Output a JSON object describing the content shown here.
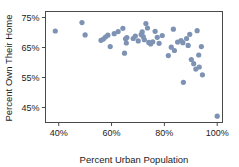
{
  "chart_data": {
    "type": "scatter",
    "title": "",
    "xlabel": "Percent Urban Population",
    "ylabel": "Percent Own Their Home",
    "xlim": [
      35,
      102
    ],
    "ylim": [
      40,
      77
    ],
    "grid": false,
    "legend": null,
    "xticks": [
      40,
      60,
      80,
      100
    ],
    "xtick_labels": [
      "40%",
      "60%",
      "80%",
      "100%"
    ],
    "yticks": [
      45,
      55,
      65,
      75
    ],
    "ytick_labels": [
      "45%",
      "55%",
      "65%",
      "75%"
    ],
    "marker": {
      "shape": "circle",
      "color": "#7e93b4",
      "size": 2.6
    },
    "frame_color": "#4a4a4a",
    "points": [
      {
        "x": 38.7,
        "y": 70.5
      },
      {
        "x": 48.8,
        "y": 73.3
      },
      {
        "x": 50.0,
        "y": 69.2
      },
      {
        "x": 56.0,
        "y": 67.4
      },
      {
        "x": 56.9,
        "y": 67.8
      },
      {
        "x": 57.7,
        "y": 68.5
      },
      {
        "x": 58.6,
        "y": 69.1
      },
      {
        "x": 59.5,
        "y": 65.3
      },
      {
        "x": 61.0,
        "y": 69.6
      },
      {
        "x": 62.5,
        "y": 70.3
      },
      {
        "x": 64.3,
        "y": 71.4
      },
      {
        "x": 64.9,
        "y": 63.1
      },
      {
        "x": 65.3,
        "y": 67.9
      },
      {
        "x": 65.6,
        "y": 66.5
      },
      {
        "x": 65.8,
        "y": 68.3
      },
      {
        "x": 68.2,
        "y": 68.0
      },
      {
        "x": 69.0,
        "y": 68.8
      },
      {
        "x": 70.1,
        "y": 67.2
      },
      {
        "x": 71.2,
        "y": 69.3
      },
      {
        "x": 71.6,
        "y": 70.2
      },
      {
        "x": 72.0,
        "y": 68.6
      },
      {
        "x": 72.4,
        "y": 67.6
      },
      {
        "x": 73.0,
        "y": 73.0
      },
      {
        "x": 73.6,
        "y": 71.5
      },
      {
        "x": 74.1,
        "y": 66.7
      },
      {
        "x": 74.8,
        "y": 66.2
      },
      {
        "x": 75.6,
        "y": 66.9
      },
      {
        "x": 76.5,
        "y": 70.4
      },
      {
        "x": 77.3,
        "y": 68.4
      },
      {
        "x": 78.0,
        "y": 66.4
      },
      {
        "x": 79.2,
        "y": 69.0
      },
      {
        "x": 81.5,
        "y": 62.3
      },
      {
        "x": 82.6,
        "y": 65.1
      },
      {
        "x": 83.4,
        "y": 71.1
      },
      {
        "x": 83.8,
        "y": 64.0
      },
      {
        "x": 85.0,
        "y": 66.8
      },
      {
        "x": 86.3,
        "y": 67.3
      },
      {
        "x": 87.0,
        "y": 66.6
      },
      {
        "x": 87.2,
        "y": 53.4
      },
      {
        "x": 88.4,
        "y": 68.0
      },
      {
        "x": 89.0,
        "y": 65.7
      },
      {
        "x": 89.6,
        "y": 69.4
      },
      {
        "x": 90.2,
        "y": 61.0
      },
      {
        "x": 91.1,
        "y": 59.6
      },
      {
        "x": 91.9,
        "y": 57.8
      },
      {
        "x": 92.4,
        "y": 70.6
      },
      {
        "x": 93.0,
        "y": 62.5
      },
      {
        "x": 93.2,
        "y": 58.5
      },
      {
        "x": 94.0,
        "y": 65.3
      },
      {
        "x": 94.4,
        "y": 55.9
      },
      {
        "x": 100.0,
        "y": 42.1
      }
    ]
  }
}
